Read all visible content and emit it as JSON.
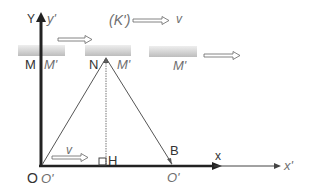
{
  "diagram": {
    "frame_K": {
      "label": "(K')",
      "velocity_label": "v"
    },
    "axes": {
      "y_label": "Y",
      "y_prime_label": "y'",
      "x_label": "x",
      "x_prime_label": "x'",
      "origin_label": "O",
      "origin_prime_label": "O'"
    },
    "mirror_positions": [
      {
        "left_label": "M",
        "right_label": "M'"
      },
      {
        "left_label": "N",
        "right_label": "M'"
      },
      {
        "left_label": "",
        "right_label": "M'"
      }
    ],
    "points": {
      "foot": "H",
      "reflect_end": "B",
      "moved_origin": "O'"
    },
    "ground_velocity_label": "v",
    "colors": {
      "axis": "#333333",
      "line": "#555555",
      "bar_fill": "#d9d9d9",
      "italic_text": "#6f6f6f"
    }
  }
}
